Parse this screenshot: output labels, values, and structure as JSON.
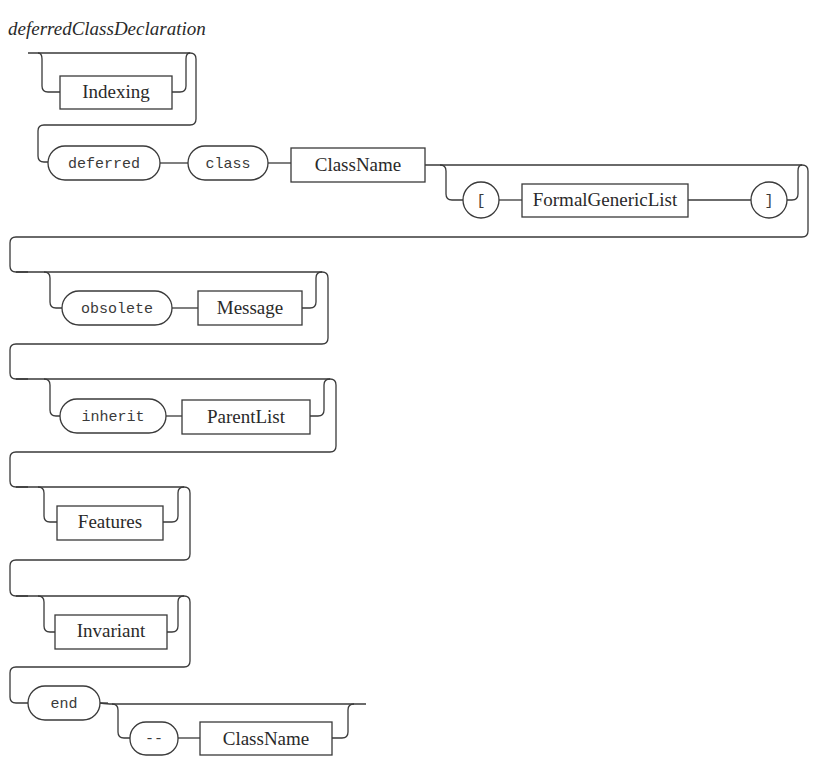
{
  "diagram": {
    "title": "deferredClassDeclaration",
    "type": "railroad-syntax-diagram",
    "colors": {
      "line": "#3a3a3a",
      "text": "#2a2a2a",
      "background": "#ffffff"
    },
    "nonterminals": {
      "indexing": "Indexing",
      "class_name": "ClassName",
      "formal_generic_list": "FormalGenericList",
      "message": "Message",
      "parent_list": "ParentList",
      "features": "Features",
      "invariant": "Invariant",
      "end_class_name": "ClassName"
    },
    "terminals": {
      "deferred": "deferred",
      "class": "class",
      "open_bracket": "[",
      "close_bracket": "]",
      "obsolete": "obsolete",
      "inherit": "inherit",
      "end": "end",
      "comment_dash": "--"
    },
    "sequence": [
      {
        "optional": true,
        "items": [
          "Indexing"
        ]
      },
      {
        "optional": false,
        "items": [
          "deferred",
          "class",
          "ClassName"
        ]
      },
      {
        "optional": true,
        "items": [
          "[",
          "FormalGenericList",
          "]"
        ]
      },
      {
        "optional": true,
        "items": [
          "obsolete",
          "Message"
        ]
      },
      {
        "optional": true,
        "items": [
          "inherit",
          "ParentList"
        ]
      },
      {
        "optional": true,
        "items": [
          "Features"
        ]
      },
      {
        "optional": true,
        "items": [
          "Invariant"
        ]
      },
      {
        "optional": false,
        "items": [
          "end"
        ]
      },
      {
        "optional": true,
        "items": [
          "--",
          "ClassName"
        ]
      }
    ]
  }
}
